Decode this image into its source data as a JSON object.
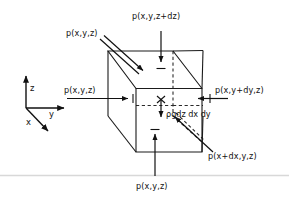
{
  "figure": {
    "stroke_color": "#111111",
    "background_color": "#ffffff",
    "labels": {
      "top_face": "p(x,y,z+dz)",
      "back_top_left": "p(x,y,z)",
      "left_face": "p(x,y,z)",
      "right_face": "p(x,y+dy,z)",
      "body_force": "ρgdz dx dy",
      "front_face": "p(x+dx,y,z)",
      "bottom_face": "p(x,y,z)"
    },
    "axes": {
      "z_label": "z",
      "y_label": "y",
      "x_label": "x"
    }
  }
}
